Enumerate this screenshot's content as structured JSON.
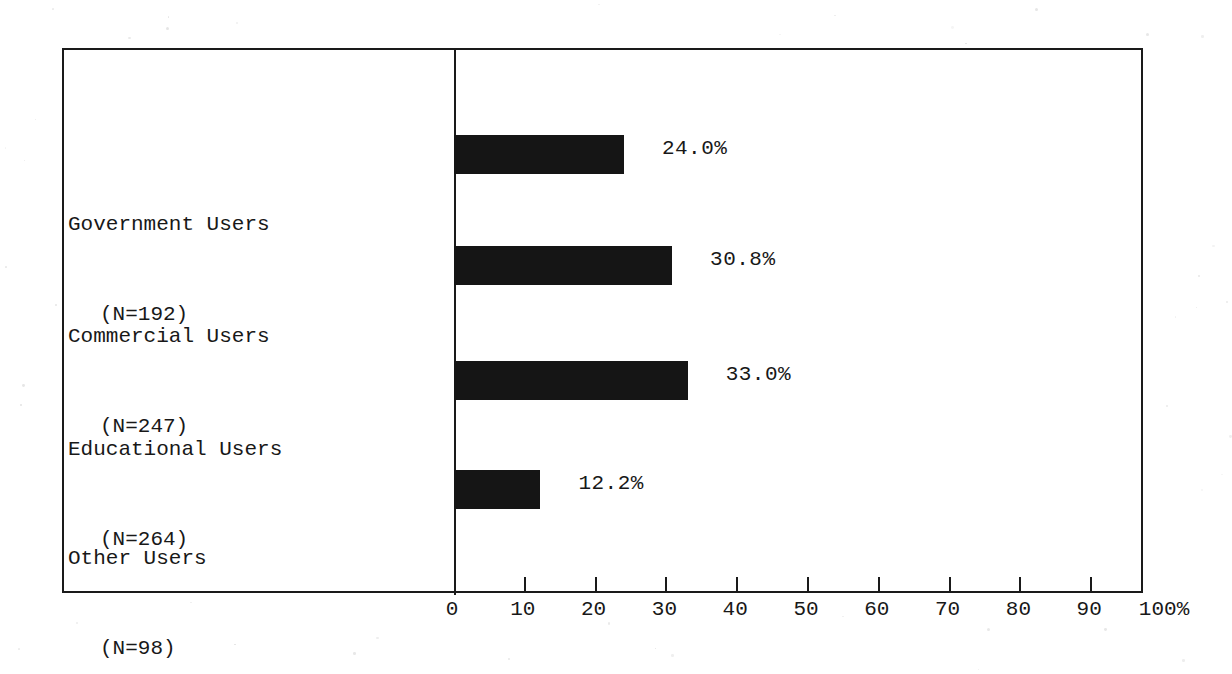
{
  "chart_data": {
    "type": "bar",
    "orientation": "horizontal",
    "title": "",
    "xlabel": "",
    "ylabel": "",
    "xlim": [
      0,
      100
    ],
    "grid": false,
    "legend": null,
    "categories": [
      "Government Users",
      "Commercial Users",
      "Educational Users",
      "Other Users"
    ],
    "category_counts": [
      "(N=192)",
      "(N=247)",
      "(N=264)",
      "(N=98)"
    ],
    "values": [
      24.0,
      30.8,
      33.0,
      12.2
    ],
    "value_labels": [
      "24.0%",
      "30.8%",
      "33.0%",
      "12.2%"
    ],
    "xticks": [
      0,
      10,
      20,
      30,
      40,
      50,
      60,
      70,
      80,
      90,
      100
    ],
    "xticklabels": [
      "0",
      "10",
      "20",
      "30",
      "40",
      "50",
      "60",
      "70",
      "80",
      "90",
      "100%"
    ],
    "bar_color": "#151515",
    "axis_color": "#1a1a1a",
    "background_color": "#ffffff"
  },
  "rows": [
    {
      "name": "Government Users",
      "count": "(N=192)",
      "value": 24.0,
      "label": "24.0%"
    },
    {
      "name": "Commercial Users",
      "count": "(N=247)",
      "value": 30.8,
      "label": "30.8%"
    },
    {
      "name": "Educational Users",
      "count": "(N=264)",
      "value": 33.0,
      "label": "33.0%"
    },
    {
      "name": "Other Users",
      "count": "(N=98)",
      "value": 12.2,
      "label": "12.2%"
    }
  ],
  "axis": {
    "ticks": [
      "0",
      "10",
      "20",
      "30",
      "40",
      "50",
      "60",
      "70",
      "80",
      "90",
      "100%"
    ]
  }
}
